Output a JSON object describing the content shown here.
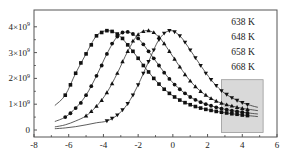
{
  "chart_data": {
    "type": "scatter",
    "title": "",
    "xlabel": "",
    "ylabel": "",
    "xlim": [
      -8,
      6
    ],
    "ylim": [
      -250000000.0,
      4500000000.0
    ],
    "xticks": [
      -8,
      -6,
      -4,
      -2,
      0,
      2,
      4,
      6
    ],
    "xtick_labels": [
      "-8",
      "-6",
      "-4",
      "-2",
      "0",
      "2",
      "4",
      "6"
    ],
    "yticks": [
      0,
      1000000000.0,
      2000000000.0,
      3000000000.0,
      4000000000.0
    ],
    "ytick_labels": [
      "0",
      "1×10⁹",
      "2×10⁹",
      "3×10⁹",
      "4×10⁹"
    ],
    "grid": false,
    "legend": {
      "placement": "top-right",
      "entries": [
        "638 K",
        "648 K",
        "658 K",
        "668 K"
      ]
    },
    "highlight_region": {
      "x": [
        2.8,
        5.2
      ],
      "y": [
        -100000000.0,
        1950000000.0
      ],
      "color": "#d9d9d9"
    },
    "series": [
      {
        "name": "638 K",
        "marker": "square",
        "x": [
          -6.2,
          -5.9,
          -5.6,
          -5.3,
          -5.0,
          -4.7,
          -4.4,
          -4.1,
          -3.8,
          -3.5,
          -3.2,
          -2.9,
          -2.6,
          -2.3,
          -2.0,
          -1.7,
          -1.4,
          -1.1,
          -0.8,
          -0.5,
          -0.2,
          0.1,
          0.4,
          0.7,
          1.0,
          1.3,
          1.6,
          1.9,
          2.2,
          2.5,
          2.8,
          3.1,
          3.4,
          3.7,
          4.0,
          4.3
        ],
        "values": [
          1350000000.0,
          1750000000.0,
          2200000000.0,
          2600000000.0,
          2950000000.0,
          3300000000.0,
          3650000000.0,
          3780000000.0,
          3850000000.0,
          3820000000.0,
          3720000000.0,
          3550000000.0,
          3300000000.0,
          3050000000.0,
          2780000000.0,
          2500000000.0,
          2250000000.0,
          2000000000.0,
          1780000000.0,
          1580000000.0,
          1420000000.0,
          1280000000.0,
          1160000000.0,
          1060000000.0,
          980000000.0,
          910000000.0,
          850000000.0,
          800000000.0,
          760000000.0,
          720000000.0,
          690000000.0,
          660000000.0,
          630000000.0,
          610000000.0,
          580000000.0,
          560000000.0
        ],
        "fit_x": [
          -6.8,
          4.8
        ]
      },
      {
        "name": "648 K",
        "marker": "circle",
        "x": [
          -6.2,
          -5.9,
          -5.6,
          -5.3,
          -5.0,
          -4.7,
          -4.4,
          -4.1,
          -3.8,
          -3.5,
          -3.2,
          -2.9,
          -2.6,
          -2.3,
          -2.0,
          -1.7,
          -1.4,
          -1.1,
          -0.8,
          -0.5,
          -0.2,
          0.1,
          0.4,
          0.7,
          1.0,
          1.3,
          1.6,
          1.9,
          2.2,
          2.5,
          2.8,
          3.1,
          3.4,
          3.7,
          4.0,
          4.3
        ],
        "values": [
          500000000.0,
          650000000.0,
          850000000.0,
          1050000000.0,
          1350000000.0,
          1700000000.0,
          2100000000.0,
          2500000000.0,
          2950000000.0,
          3350000000.0,
          3620000000.0,
          3780000000.0,
          3800000000.0,
          3720000000.0,
          3550000000.0,
          3320000000.0,
          3050000000.0,
          2780000000.0,
          2500000000.0,
          2220000000.0,
          1980000000.0,
          1760000000.0,
          1580000000.0,
          1420000000.0,
          1280000000.0,
          1170000000.0,
          1080000000.0,
          1000000000.0,
          940000000.0,
          880000000.0,
          830000000.0,
          790000000.0,
          750000000.0,
          720000000.0,
          690000000.0,
          660000000.0
        ],
        "fit_x": [
          -6.8,
          4.8
        ]
      },
      {
        "name": "658 K",
        "marker": "triangle-up",
        "x": [
          -5.0,
          -4.7,
          -4.4,
          -4.1,
          -3.8,
          -3.5,
          -3.2,
          -2.9,
          -2.6,
          -2.3,
          -2.0,
          -1.7,
          -1.4,
          -1.1,
          -0.8,
          -0.5,
          -0.2,
          0.1,
          0.4,
          0.7,
          1.0,
          1.3,
          1.6,
          1.9,
          2.2,
          2.5,
          2.8,
          3.1,
          3.4,
          3.7,
          4.0,
          4.3
        ],
        "values": [
          550000000.0,
          720000000.0,
          920000000.0,
          1150000000.0,
          1450000000.0,
          1800000000.0,
          2200000000.0,
          2650000000.0,
          3050000000.0,
          3450000000.0,
          3700000000.0,
          3820000000.0,
          3850000000.0,
          3780000000.0,
          3600000000.0,
          3350000000.0,
          3050000000.0,
          2750000000.0,
          2450000000.0,
          2150000000.0,
          1900000000.0,
          1680000000.0,
          1500000000.0,
          1350000000.0,
          1220000000.0,
          1120000000.0,
          1040000000.0,
          980000000.0,
          930000000.0,
          880000000.0,
          840000000.0,
          800000000.0
        ],
        "fit_x": [
          -6.8,
          4.8
        ]
      },
      {
        "name": "668 K",
        "marker": "triangle-down",
        "x": [
          -3.8,
          -3.5,
          -3.2,
          -2.9,
          -2.6,
          -2.3,
          -2.0,
          -1.7,
          -1.4,
          -1.1,
          -0.8,
          -0.5,
          -0.2,
          0.1,
          0.4,
          0.7,
          1.0,
          1.3,
          1.6,
          1.9,
          2.2,
          2.5,
          2.8,
          3.1,
          3.4,
          3.7,
          4.0,
          4.3
        ],
        "values": [
          350000000.0,
          450000000.0,
          580000000.0,
          780000000.0,
          1020000000.0,
          1350000000.0,
          1750000000.0,
          2200000000.0,
          2650000000.0,
          3100000000.0,
          3500000000.0,
          3750000000.0,
          3850000000.0,
          3800000000.0,
          3650000000.0,
          3400000000.0,
          3100000000.0,
          2800000000.0,
          2500000000.0,
          2200000000.0,
          1950000000.0,
          1720000000.0,
          1520000000.0,
          1380000000.0,
          1250000000.0,
          1150000000.0,
          1060000000.0,
          980000000.0
        ],
        "fit_x": [
          -6.8,
          4.8
        ]
      }
    ],
    "fit_curves": [
      {
        "name": "638 K fit",
        "x": [
          -6.8,
          -6.2,
          -5.6,
          -5.0,
          -4.4,
          -3.8,
          -3.2,
          -2.6,
          -2.0,
          -1.4,
          -0.8,
          -0.2,
          0.4,
          1.0,
          1.6,
          2.2,
          2.8,
          3.4,
          4.0,
          4.6,
          4.9
        ],
        "values": [
          950000000.0,
          1350000000.0,
          2200000000.0,
          2950000000.0,
          3650000000.0,
          3850000000.0,
          3720000000.0,
          3300000000.0,
          2780000000.0,
          2250000000.0,
          1780000000.0,
          1420000000.0,
          1160000000.0,
          980000000.0,
          850000000.0,
          760000000.0,
          690000000.0,
          630000000.0,
          580000000.0,
          540000000.0,
          520000000.0
        ]
      },
      {
        "name": "648 K fit",
        "x": [
          -6.8,
          -6.2,
          -5.6,
          -5.0,
          -4.4,
          -3.8,
          -3.2,
          -2.6,
          -2.0,
          -1.4,
          -0.8,
          -0.2,
          0.4,
          1.0,
          1.6,
          2.2,
          2.8,
          3.4,
          4.0,
          4.6,
          4.9
        ],
        "values": [
          330000000.0,
          500000000.0,
          850000000.0,
          1350000000.0,
          2100000000.0,
          2950000000.0,
          3620000000.0,
          3800000000.0,
          3550000000.0,
          3050000000.0,
          2500000000.0,
          1980000000.0,
          1580000000.0,
          1280000000.0,
          1080000000.0,
          940000000.0,
          830000000.0,
          750000000.0,
          690000000.0,
          640000000.0,
          620000000.0
        ]
      },
      {
        "name": "658 K fit",
        "x": [
          -6.8,
          -6.2,
          -5.6,
          -5.0,
          -4.4,
          -3.8,
          -3.2,
          -2.6,
          -2.0,
          -1.4,
          -0.8,
          -0.2,
          0.4,
          1.0,
          1.6,
          2.2,
          2.8,
          3.4,
          4.0,
          4.6,
          4.9
        ],
        "values": [
          120000000.0,
          200000000.0,
          350000000.0,
          550000000.0,
          920000000.0,
          1450000000.0,
          2200000000.0,
          3050000000.0,
          3700000000.0,
          3850000000.0,
          3600000000.0,
          3050000000.0,
          2450000000.0,
          1900000000.0,
          1500000000.0,
          1220000000.0,
          1040000000.0,
          930000000.0,
          840000000.0,
          780000000.0,
          750000000.0
        ]
      },
      {
        "name": "668 K fit",
        "x": [
          -6.8,
          -6.2,
          -5.6,
          -5.0,
          -4.4,
          -3.8,
          -3.2,
          -2.6,
          -2.0,
          -1.4,
          -0.8,
          -0.2,
          0.4,
          1.0,
          1.6,
          2.2,
          2.8,
          3.4,
          4.0,
          4.6,
          4.9
        ],
        "values": [
          50000000.0,
          80000000.0,
          130000000.0,
          200000000.0,
          280000000.0,
          350000000.0,
          580000000.0,
          1020000000.0,
          1750000000.0,
          2650000000.0,
          3500000000.0,
          3850000000.0,
          3650000000.0,
          3100000000.0,
          2500000000.0,
          1950000000.0,
          1520000000.0,
          1250000000.0,
          1060000000.0,
          930000000.0,
          880000000.0
        ]
      }
    ]
  }
}
